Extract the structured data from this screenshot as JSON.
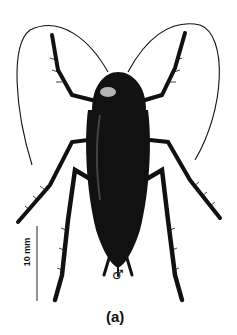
{
  "figure": {
    "scale_bar_label": "10 mm",
    "sex_symbol": "♂",
    "panel_label": "(a)",
    "colors": {
      "ink": "#111111",
      "background": "#ffffff"
    }
  }
}
